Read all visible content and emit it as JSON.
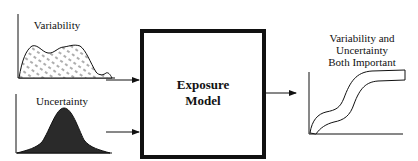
{
  "inputs": [
    {
      "label": "Variability",
      "fill": "hatched"
    },
    {
      "label": "Uncertainty",
      "fill": "#2a2a2a"
    }
  ],
  "model": {
    "line1": "Exposure",
    "line2": "Model"
  },
  "output": {
    "line1": "Variability and",
    "line2": "Uncertainty",
    "line3": "Both Important"
  }
}
